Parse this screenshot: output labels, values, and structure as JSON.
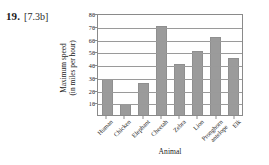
{
  "problem": {
    "number": "19.",
    "reference": "[7.3b]"
  },
  "chart_data": {
    "type": "bar",
    "title": "",
    "xlabel": "Animal",
    "ylabel": "Maximum speed (in miles per hour)",
    "ylabel_line1": "Maximum speed",
    "ylabel_line2": "(in miles per hour)",
    "categories": [
      "Human",
      "Chicken",
      "Elephant",
      "Cheetah",
      "Zebra",
      "Lion",
      "Pronghorn antelope",
      "Elk"
    ],
    "category_lines": [
      [
        "Human"
      ],
      [
        "Chicken"
      ],
      [
        "Elephant"
      ],
      [
        "Cheetah"
      ],
      [
        "Zebra"
      ],
      [
        "Lion"
      ],
      [
        "Pronghorn",
        "antelope"
      ],
      [
        "Elk"
      ]
    ],
    "values": [
      28,
      9,
      25,
      70,
      40,
      50,
      61,
      45
    ],
    "ylim": [
      0,
      80
    ],
    "ytick_labels": [
      "10",
      "20",
      "30",
      "40",
      "50",
      "60",
      "70",
      "80"
    ],
    "ytick_values": [
      10,
      20,
      30,
      40,
      50,
      60,
      70,
      80
    ],
    "grid": true,
    "legend": "none",
    "bar_color": "#9b9b9b",
    "axis_color": "#8a8a8a",
    "gridline_color": "#9a9a9a",
    "background_color": "#ffffff"
  }
}
